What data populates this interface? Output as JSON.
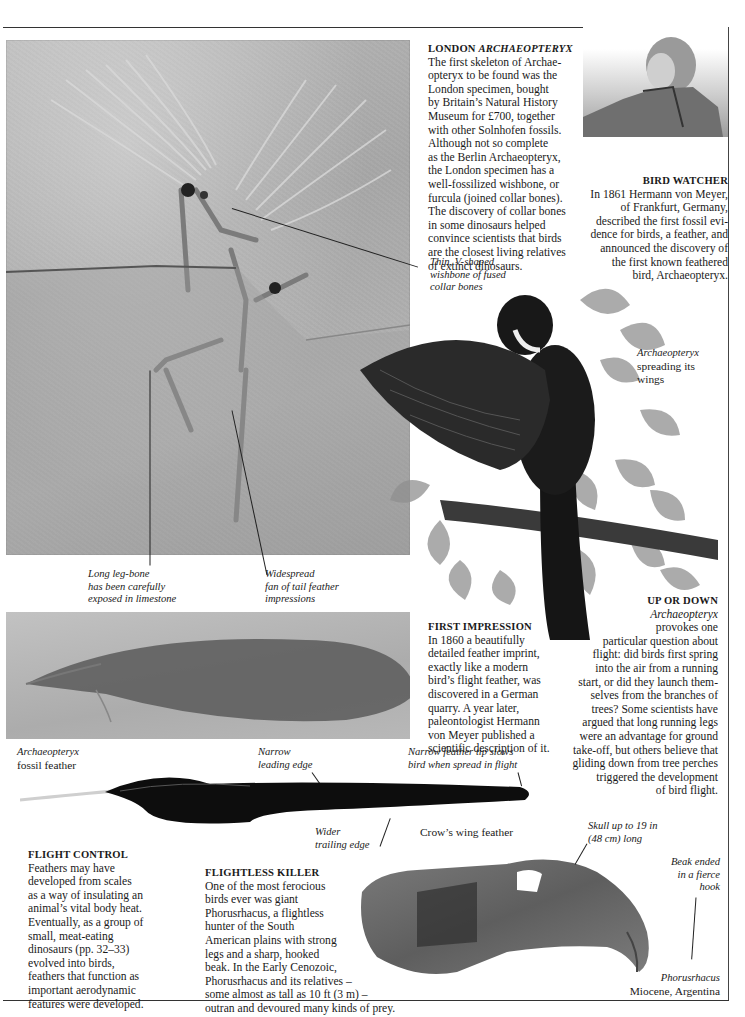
{
  "london_archaeopteryx": {
    "heading_plain": "LONDON ",
    "heading_italic": "ARCHAEOPTERYX",
    "lines": [
      "The first skeleton of Archae-",
      "opteryx to be found was the",
      "London specimen, bought",
      "by Britain’s Natural History",
      "Museum for £700, together",
      "with other Solnhofen fossils.",
      "Although not so complete",
      "as the Berlin Archaeopteryx,",
      "the London specimen has a",
      "well-fossilized wishbone, or",
      "furcula (joined collar bones).",
      "The discovery of collar bones",
      "in some dinosaurs helped",
      "convince scientists that birds",
      "are the closest living relatives",
      "of extinct dinosaurs."
    ]
  },
  "bird_watcher": {
    "heading": "BIRD WATCHER",
    "lines": [
      "In 1861 Hermann von Meyer,",
      "of Frankfurt, Germany,",
      "described the first fossil evi-",
      "dence for birds, a feather, and",
      "announced the discovery of",
      "the first known feathered",
      "bird, Archaeopteryx."
    ]
  },
  "wishbone_caption": [
    "Thin, V-shaped",
    "wishbone of fused",
    "collar bones"
  ],
  "bird_caption": {
    "italic": "Archaeopteryx",
    "lines": [
      "spreading its",
      "wings"
    ]
  },
  "leg_caption": [
    "Long leg-bone",
    "has been carefully",
    "exposed in limestone"
  ],
  "tail_caption": [
    "Widespread",
    "fan of tail feather",
    "impressions"
  ],
  "first_impression": {
    "heading": "FIRST IMPRESSION",
    "lines": [
      "In 1860 a beautifully",
      "detailed feather imprint,",
      "exactly like a modern",
      "bird’s flight feather, was",
      "discovered in a German",
      "quarry. A year later,",
      "paleontologist Hermann",
      "von Meyer published a",
      "scientific description of it."
    ]
  },
  "up_or_down": {
    "heading": "UP OR DOWN",
    "italic_first": "Archaeopteryx",
    "lines": [
      "provokes one",
      "particular question about",
      "flight: did birds first spring",
      "into the air from a running",
      "start, or did they launch them-",
      "selves from the branches of",
      "trees? Some scientists have",
      "argued that long running legs",
      "were an advantage for ground",
      "take-off, but others believe that",
      "gliding down from tree perches",
      "triggered the development",
      "of bird flight."
    ]
  },
  "fossil_feather_caption": {
    "italic": "Archaeopteryx",
    "plain": "fossil feather"
  },
  "leading_edge_caption": [
    "Narrow",
    "leading edge"
  ],
  "tip_caption": [
    "Narrow feather tip slows",
    "bird when spread in flight"
  ],
  "trailing_edge_caption": [
    "Wider",
    "trailing edge"
  ],
  "crow_feather_caption": "Crow’s wing feather",
  "flight_control": {
    "heading": "FLIGHT CONTROL",
    "lines": [
      "Feathers may have",
      "developed from scales",
      "as a way of insulating an",
      "animal’s vital body heat.",
      "Eventually, as a group of",
      "small, meat-eating",
      "dinosaurs (pp. 32–33)",
      "evolved into birds,",
      "feathers that function as",
      "important aerodynamic",
      "features were developed."
    ]
  },
  "flightless_killer": {
    "heading": "FLIGHTLESS KILLER",
    "lines": [
      "One of the most ferocious",
      "birds ever was giant",
      "Phorusrhacus, a flightless",
      "hunter of the South",
      "American plains with strong",
      "legs and a sharp, hooked",
      "beak. In the Early Cenozoic,",
      "Phorusrhacus and its relatives –",
      "some almost as tall as 10 ft (3 m) –",
      "outran and devoured many kinds of prey."
    ]
  },
  "skull_caption": [
    "Skull up to 19 in",
    "(48 cm) long"
  ],
  "beak_caption": [
    "Beak ended",
    "in a fierce",
    "hook"
  ],
  "phorusrhacus_caption": {
    "italic": "Phorusrhacus",
    "plain": "Miocene, Argentina"
  },
  "colors": {
    "ink": "#1a1a1a",
    "slab": "#acacac",
    "feather": "#0d0d0d",
    "rule": "#333333"
  }
}
